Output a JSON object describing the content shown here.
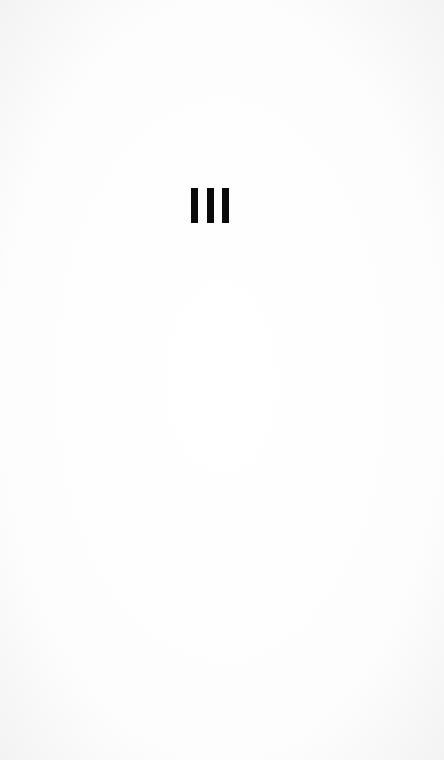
{
  "screen": {
    "type": "splash",
    "background_color": "#fdfdfd"
  },
  "logo": {
    "icon": "three-vertical-bars-icon",
    "glyph": "III",
    "bar_count": 3,
    "bar_color": "#0a0a0a"
  }
}
